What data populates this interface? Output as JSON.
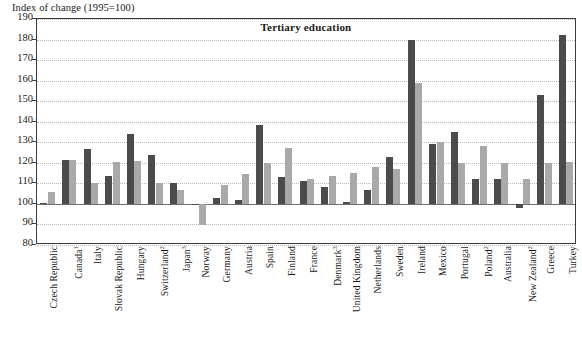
{
  "axis_caption": "Index of change (1995=100)",
  "title": "Tertiary education",
  "colors": {
    "series_1": "#4b4b4b",
    "series_2": "#a9a9a9",
    "frame": "#3b3b3b",
    "gridline": "#b9b9b9",
    "background": "#ffffff"
  },
  "chart_data": {
    "type": "bar",
    "title": "Tertiary education",
    "xlabel": "",
    "ylabel": "Index of change (1995=100)",
    "ylim": [
      80,
      190
    ],
    "yticks": [
      80,
      90,
      100,
      110,
      120,
      130,
      140,
      150,
      160,
      170,
      180,
      190
    ],
    "grid": true,
    "legend_position": "none",
    "baseline": 100,
    "categories": [
      "Czech Republic",
      "Canada",
      "Italy",
      "Slovak Republic",
      "Hungary",
      "Switzerland",
      "Japan",
      "Norway",
      "Germany",
      "Austria",
      "Spain",
      "Finland",
      "France",
      "Denmark",
      "United Kingdom",
      "Netherlands",
      "Sweden",
      "Ireland",
      "Mexico",
      "Portugal",
      "Poland",
      "Australia",
      "New Zealand",
      "Greece",
      "Turkey"
    ],
    "category_footnotes": [
      "",
      "1",
      "",
      "",
      "",
      "2",
      "3",
      "",
      "",
      "",
      "",
      "",
      "",
      "3",
      "",
      "",
      "",
      "",
      "",
      "",
      "2",
      "",
      "2",
      "",
      ""
    ],
    "series": [
      {
        "name": "series_1",
        "values": [
          100.5,
          121.5,
          126.5,
          113.5,
          134,
          124,
          110,
          100,
          103,
          102,
          138.5,
          113,
          111,
          108,
          101,
          107,
          123,
          180,
          129,
          135,
          112,
          112,
          98,
          153,
          182
        ]
      },
      {
        "name": "series_2",
        "values": [
          106,
          121.5,
          110,
          120.5,
          121,
          110,
          107,
          89.5,
          109,
          114.5,
          120,
          127,
          112,
          113.5,
          115,
          118,
          117,
          159,
          130,
          120,
          128,
          120,
          112,
          120,
          120.5
        ]
      }
    ]
  }
}
